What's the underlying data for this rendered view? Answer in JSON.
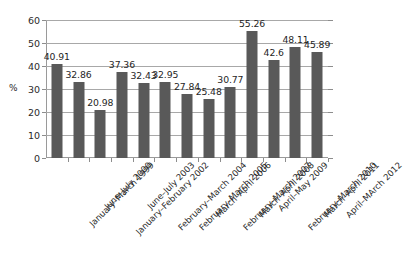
{
  "chart_data": {
    "type": "bar",
    "title": "",
    "subtitle": "",
    "xlabel": "",
    "ylabel": "%",
    "ylim": [
      0,
      60
    ],
    "ytick_step": 10,
    "yticks": [
      "60",
      "50",
      "40",
      "30",
      "20",
      "10",
      "0"
    ],
    "grid": true,
    "legend": false,
    "legend_position": "none",
    "orientation": "vertical",
    "bar_color": "#595959",
    "gridline_color": "#a8a8a8",
    "axis_color": "#8d8d8d",
    "categories": [
      "January–March 1999",
      "June–July 2000",
      "January–February 2002",
      "June–July 2003",
      "February–March 2004",
      "February–March 2005",
      "March–April 2006",
      "February–March 2007",
      "March–April 2008",
      "April–May 2009",
      "February–March 2010",
      "March–April 2011",
      "April–MArch 2012"
    ],
    "values": [
      40.91,
      32.86,
      20.98,
      37.36,
      32.43,
      32.95,
      27.84,
      25.48,
      30.77,
      55.26,
      42.6,
      48.11,
      45.89
    ],
    "data_labels": [
      "40.91",
      "32.86",
      "20.98",
      "37.36",
      "32.43",
      "32.95",
      "27.84",
      "25.48",
      "30.77",
      "55.26",
      "42.6",
      "48.11",
      "45.89"
    ]
  }
}
